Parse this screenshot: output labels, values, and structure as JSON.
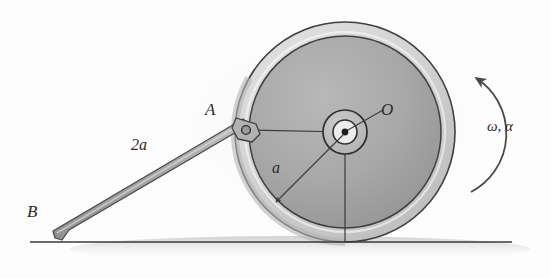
{
  "figure": {
    "labels": {
      "point_A": "A",
      "point_B": "B",
      "point_O": "O",
      "radius_a": "a",
      "rod_length": "2a",
      "angular_motion": "ω, α"
    },
    "colors": {
      "ink": "#2b2b2b",
      "line": "#3a3a3a",
      "rim_fill": "#d6d6d6",
      "disk_fill": "#a8a8a8",
      "hub_fill": "#bdbdbd",
      "hub_core": "#e8e8e8",
      "rod_fill": "#a5a5a5",
      "ground": "#3a3a3a",
      "shadow": "#cfcfcf",
      "background": "#fdfdfd"
    },
    "geometry": {
      "wheel_center_x": 345,
      "wheel_center_y": 132,
      "outer_radius": 110,
      "inner_disk_radius": 96,
      "hub_outer_radius": 22,
      "hub_inner_radius": 12,
      "point_A_x": 246,
      "point_A_y": 130,
      "point_B_x": 62,
      "point_B_y": 239,
      "ground_y": 242,
      "ground_x_start": 30,
      "ground_x_end": 512
    }
  }
}
